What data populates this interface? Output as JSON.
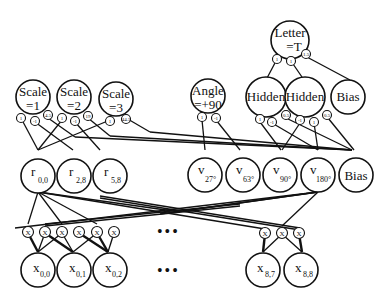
{
  "diagram": {
    "top": {
      "letter": {
        "line1": "Letter",
        "line2": "=T",
        "weights": [
          "1",
          "1",
          "1.5"
        ]
      },
      "hidden": [
        {
          "label": "Hidden",
          "weights": [
            "1",
            "-1",
            "0.5"
          ]
        },
        {
          "label": "Hidden",
          "weights": [
            "-1",
            "1",
            "0.5"
          ]
        }
      ],
      "bias": {
        "label": "Bias"
      }
    },
    "features": {
      "scales": [
        {
          "line1": "Scale",
          "line2": "=1",
          "weights": [
            "1",
            "-1",
            "4.5"
          ]
        },
        {
          "line1": "Scale",
          "line2": "=2",
          "weights": [
            "1",
            "-1",
            "19"
          ]
        },
        {
          "line1": "Scale",
          "line2": "=3",
          "weights": [
            "1",
            "44.5"
          ]
        }
      ],
      "angle": {
        "line1": "Angle",
        "line2": "=+90",
        "weights": [
          "1",
          "-1"
        ]
      }
    },
    "middle": {
      "r_nodes": [
        {
          "base": "r",
          "sub": "0,0"
        },
        {
          "base": "r",
          "sub": "2,8"
        },
        {
          "base": "r",
          "sub": "5,8"
        }
      ],
      "v_nodes": [
        {
          "base": "v",
          "sub": "27°"
        },
        {
          "base": "v",
          "sub": "63°"
        },
        {
          "base": "v",
          "sub": "90°"
        },
        {
          "base": "v",
          "sub": "180°"
        }
      ],
      "bias": {
        "label": "Bias"
      }
    },
    "product_units": {
      "symbol": "X"
    },
    "inputs": {
      "left": [
        {
          "base": "x",
          "sub": "0,0"
        },
        {
          "base": "x",
          "sub": "0,1"
        },
        {
          "base": "x",
          "sub": "0,2"
        }
      ],
      "right": [
        {
          "base": "x",
          "sub": "8,7"
        },
        {
          "base": "x",
          "sub": "8,8"
        }
      ],
      "ellipsis": "•••"
    }
  }
}
